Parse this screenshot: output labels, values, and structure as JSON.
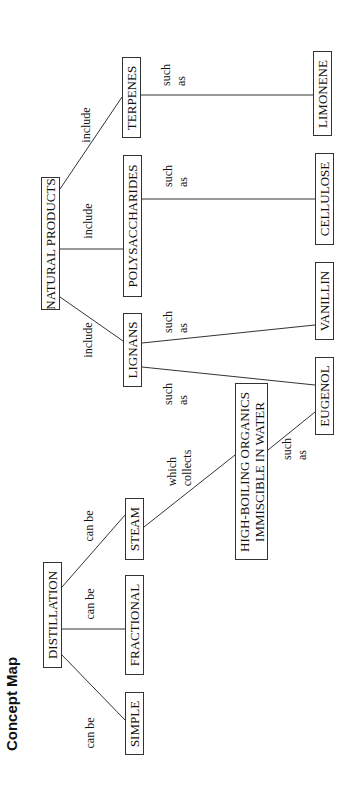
{
  "title": "Concept Map",
  "nodes": {
    "distillation": "DISTILLATION",
    "simple": "SIMPLE",
    "fractional": "FRACTIONAL",
    "steam": "STEAM",
    "high_boiling_line1": "HIGH-BOILING ORGANICS",
    "high_boiling_line2": "IMMISCIBLE IN WATER",
    "eugenol": "EUGENOL",
    "lignans": "LIGNANS",
    "vanillin": "VANILLIN",
    "natural_products": "NATURAL PRODUCTS",
    "polysaccharides": "POLYSACCHARIDES",
    "cellulose": "CELLULOSE",
    "terpenes": "TERPENES",
    "limonene": "LIMONENE"
  },
  "links": {
    "dist_simple": "can be",
    "dist_fractional": "can be",
    "dist_steam": "can be",
    "steam_highboiling": "which\ncollects",
    "highboiling_eugenol": "such\nas",
    "lignans_eugenol": "such\nas",
    "lignans_vanillin": "such\nas",
    "np_lignans": "include",
    "np_polysaccharides": "include",
    "np_terpenes": "include",
    "poly_cellulose": "such\nas",
    "terpenes_limonene": "such\nas"
  },
  "edges": [
    {
      "from": "DISTILLATION",
      "to": "SIMPLE",
      "label": "can be"
    },
    {
      "from": "DISTILLATION",
      "to": "FRACTIONAL",
      "label": "can be"
    },
    {
      "from": "DISTILLATION",
      "to": "STEAM",
      "label": "can be"
    },
    {
      "from": "STEAM",
      "to": "HIGH-BOILING ORGANICS IMMISCIBLE IN WATER",
      "label": "which collects"
    },
    {
      "from": "HIGH-BOILING ORGANICS IMMISCIBLE IN WATER",
      "to": "EUGENOL",
      "label": "such as"
    },
    {
      "from": "NATURAL PRODUCTS",
      "to": "LIGNANS",
      "label": "include"
    },
    {
      "from": "NATURAL PRODUCTS",
      "to": "POLYSACCHARIDES",
      "label": "include"
    },
    {
      "from": "NATURAL PRODUCTS",
      "to": "TERPENES",
      "label": "include"
    },
    {
      "from": "LIGNANS",
      "to": "EUGENOL",
      "label": "such as"
    },
    {
      "from": "LIGNANS",
      "to": "VANILLIN",
      "label": "such as"
    },
    {
      "from": "POLYSACCHARIDES",
      "to": "CELLULOSE",
      "label": "such as"
    },
    {
      "from": "TERPENES",
      "to": "LIMONENE",
      "label": "such as"
    }
  ]
}
